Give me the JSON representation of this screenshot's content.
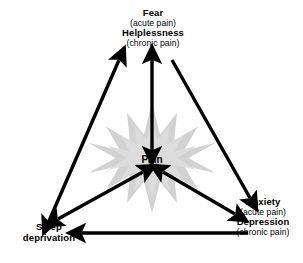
{
  "diagram": {
    "center_node": {
      "id": "pain",
      "label": "Pain"
    },
    "nodes": [
      {
        "id": "fear-helplessness",
        "position": "top",
        "lines": [
          {
            "text": "Fear",
            "style": "primary"
          },
          {
            "text": "(acute pain)",
            "style": "secondary"
          },
          {
            "text": "Helplessness",
            "style": "primary"
          },
          {
            "text": "(chronic pain)",
            "style": "secondary"
          }
        ]
      },
      {
        "id": "anxiety-depression",
        "position": "bottom-right",
        "lines": [
          {
            "text": "Anxiety",
            "style": "primary"
          },
          {
            "text": "(acute pain)",
            "style": "secondary"
          },
          {
            "text": "Depression",
            "style": "primary"
          },
          {
            "text": "(chronic pain)",
            "style": "secondary"
          }
        ]
      },
      {
        "id": "sleep-deprivation",
        "position": "bottom-left",
        "lines": [
          {
            "text": "Sleep",
            "style": "primary"
          },
          {
            "text": "deprivation",
            "style": "primary"
          }
        ]
      }
    ],
    "labels": {
      "fear_line1": "Fear",
      "fear_line2": "(acute pain)",
      "fear_line3": "Helplessness",
      "fear_line4": "(chronic pain)",
      "anxiety_line1": "Anxiety",
      "anxiety_line2": "(acute pain)",
      "anxiety_line3": "Depression",
      "anxiety_line4": "(chronic pain)",
      "sleep_line1": "Sleep",
      "sleep_line2": "deprivation",
      "pain": "Pain"
    },
    "edges": [
      {
        "id": "fear-to-sleep",
        "from": "fear-helplessness",
        "to": "sleep-deprivation",
        "arrowheads": "both"
      },
      {
        "id": "fear-to-anxiety",
        "from": "fear-helplessness",
        "to": "anxiety-depression",
        "arrowheads": "end"
      },
      {
        "id": "anxiety-to-sleep",
        "from": "anxiety-depression",
        "to": "sleep-deprivation",
        "arrowheads": "end"
      },
      {
        "id": "pain-to-fear",
        "from": "pain",
        "to": "fear-helplessness",
        "arrowheads": "both"
      },
      {
        "id": "pain-to-sleep",
        "from": "pain",
        "to": "sleep-deprivation",
        "arrowheads": "both"
      },
      {
        "id": "pain-to-anxiety",
        "from": "pain",
        "to": "anxiety-depression",
        "arrowheads": "both"
      }
    ],
    "colors": {
      "background": "#ffffff",
      "arrow": "#000000",
      "text": "#000000",
      "starburst": "#d2d2d2"
    },
    "decoration": {
      "starburst_points": 12,
      "starburst_name": "pain-starburst"
    }
  }
}
